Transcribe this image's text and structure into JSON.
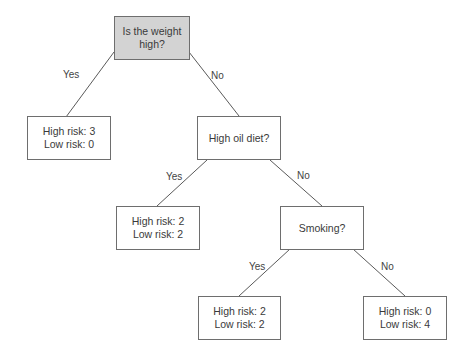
{
  "diagram": {
    "type": "decision-tree",
    "nodes": {
      "root": {
        "lines": [
          "Is the weight",
          "high?"
        ],
        "highlight_color": "#d3d3d3"
      },
      "leaf_weight_yes": {
        "lines": [
          "High risk: 3",
          "Low risk: 0"
        ]
      },
      "oil": {
        "lines": [
          "High oil diet?"
        ]
      },
      "leaf_oil_yes": {
        "lines": [
          "High risk: 2",
          "Low risk: 2"
        ]
      },
      "smoking": {
        "lines": [
          "Smoking?"
        ]
      },
      "leaf_smoking_yes": {
        "lines": [
          "High risk: 2",
          "Low risk: 2"
        ]
      },
      "leaf_smoking_no": {
        "lines": [
          "High risk: 0",
          "Low risk: 4"
        ]
      }
    },
    "edges": [
      {
        "from": "root",
        "to": "leaf_weight_yes",
        "label": "Yes"
      },
      {
        "from": "root",
        "to": "oil",
        "label": "No"
      },
      {
        "from": "oil",
        "to": "leaf_oil_yes",
        "label": "Yes"
      },
      {
        "from": "oil",
        "to": "smoking",
        "label": "No"
      },
      {
        "from": "smoking",
        "to": "leaf_smoking_yes",
        "label": "Yes"
      },
      {
        "from": "smoking",
        "to": "leaf_smoking_no",
        "label": "No"
      }
    ]
  }
}
